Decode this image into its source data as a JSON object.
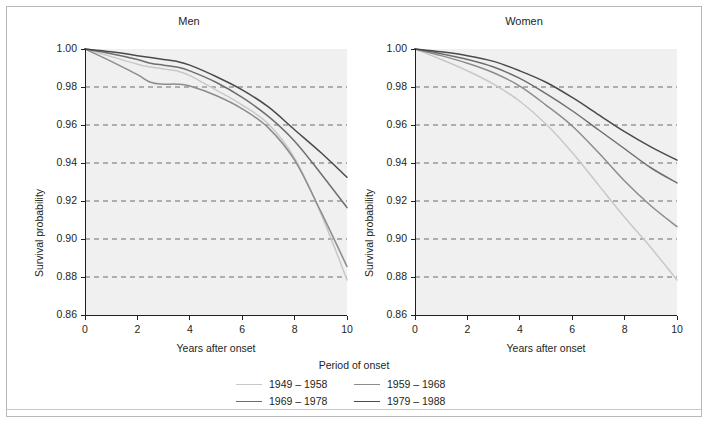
{
  "figure": {
    "legend_title": "Period of onset",
    "axis_x_title": "Years after onset",
    "axis_y_title": "Survival probability"
  },
  "chart_data": {
    "type": "line",
    "title": "",
    "xlabel": "Years after onset",
    "ylabel": "Survival probability",
    "xlim": [
      0,
      10
    ],
    "ylim": [
      0.86,
      1.0
    ],
    "xticks": [
      "0",
      "2",
      "4",
      "6",
      "8",
      "10"
    ],
    "yticks": [
      "0.86",
      "0.88",
      "0.90",
      "0.92",
      "0.94",
      "0.96",
      "0.98",
      "1.00"
    ],
    "grid": "horizontal-dashed",
    "legend_position": "bottom-center",
    "legend_title": "Period of onset",
    "panels": [
      {
        "name": "Men",
        "series": [
          {
            "name": "1949 – 1958",
            "color": "#c8c8c8",
            "x": [
              0,
              1,
              2,
              2.5,
              3,
              3.5,
              4,
              5,
              6,
              7,
              8,
              9,
              10
            ],
            "values": [
              1.0,
              0.996,
              0.992,
              0.9905,
              0.9895,
              0.9885,
              0.986,
              0.9785,
              0.9705,
              0.9605,
              0.9425,
              0.9135,
              0.8785
            ]
          },
          {
            "name": "1959 – 1968",
            "color": "#8c8c8c",
            "x": [
              0,
              1,
              2,
              2.5,
              3,
              3.5,
              4,
              5,
              6,
              7,
              8,
              9,
              10
            ],
            "values": [
              1.0,
              0.9935,
              0.9865,
              0.9825,
              0.9815,
              0.9815,
              0.9805,
              0.9755,
              0.9685,
              0.9585,
              0.9415,
              0.9145,
              0.8855
            ]
          },
          {
            "name": "1969 – 1978",
            "color": "#6e6e6e",
            "x": [
              0,
              1,
              2,
              2.5,
              3,
              3.5,
              4,
              5,
              6,
              7,
              8,
              9,
              10
            ],
            "values": [
              1.0,
              0.9975,
              0.9945,
              0.9925,
              0.9915,
              0.9905,
              0.9885,
              0.9825,
              0.9745,
              0.9645,
              0.9515,
              0.9345,
              0.9165
            ]
          },
          {
            "name": "1979 – 1988",
            "color": "#4a4a4a",
            "x": [
              0,
              1,
              2,
              2.5,
              3,
              3.5,
              4,
              5,
              6,
              7,
              8,
              9,
              10
            ],
            "values": [
              1.0,
              0.9985,
              0.9965,
              0.9955,
              0.9945,
              0.9935,
              0.9915,
              0.9855,
              0.9785,
              0.9695,
              0.9575,
              0.9455,
              0.9325
            ]
          }
        ]
      },
      {
        "name": "Women",
        "series": [
          {
            "name": "1949 – 1958",
            "color": "#c8c8c8",
            "x": [
              0,
              1,
              2,
              3,
              4,
              5,
              6,
              7,
              8,
              9,
              10
            ],
            "values": [
              1.0,
              0.9945,
              0.9885,
              0.9815,
              0.9725,
              0.9605,
              0.9455,
              0.9285,
              0.9115,
              0.8955,
              0.8785
            ]
          },
          {
            "name": "1959 – 1968",
            "color": "#8c8c8c",
            "x": [
              0,
              1,
              2,
              3,
              4,
              5,
              6,
              7,
              8,
              9,
              10
            ],
            "values": [
              1.0,
              0.9965,
              0.9925,
              0.9875,
              0.9805,
              0.9705,
              0.9595,
              0.9455,
              0.9305,
              0.9175,
              0.9065
            ]
          },
          {
            "name": "1969 – 1978",
            "color": "#6e6e6e",
            "x": [
              0,
              1,
              2,
              3,
              4,
              5,
              6,
              7,
              8,
              9,
              10
            ],
            "values": [
              1.0,
              0.9975,
              0.9945,
              0.9905,
              0.9845,
              0.9765,
              0.9675,
              0.9575,
              0.9475,
              0.9375,
              0.9295
            ]
          },
          {
            "name": "1979 – 1988",
            "color": "#4a4a4a",
            "x": [
              0,
              1,
              2,
              3,
              4,
              5,
              6,
              7,
              8,
              9,
              10
            ],
            "values": [
              1.0,
              0.9985,
              0.9965,
              0.9935,
              0.9885,
              0.9825,
              0.9745,
              0.9655,
              0.9565,
              0.9485,
              0.9415
            ]
          }
        ]
      }
    ],
    "legend": [
      {
        "label": "1949 – 1958",
        "color": "#c8c8c8"
      },
      {
        "label": "1959 – 1968",
        "color": "#8c8c8c"
      },
      {
        "label": "1969 – 1978",
        "color": "#6e6e6e"
      },
      {
        "label": "1979 – 1988",
        "color": "#4a4a4a"
      }
    ]
  }
}
